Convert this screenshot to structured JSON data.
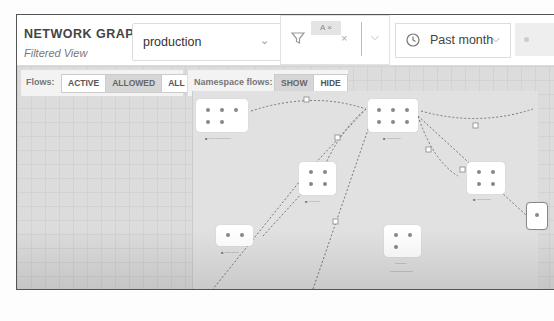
{
  "header": {
    "title": "NETWORK GRAPH",
    "subtitle": "Filtered View",
    "namespace_select": {
      "value": "production",
      "chevron": "chevron-down-icon"
    },
    "filter": {
      "chip_label": "A",
      "chip_remove": "×",
      "clear": "×",
      "chevron": "⌵"
    },
    "time_select": {
      "value": "Past month",
      "chevron": "⌵"
    }
  },
  "toolbar": {
    "flows_label": "Flows:",
    "flows_options": [
      "ACTIVE",
      "ALLOWED",
      "ALL"
    ],
    "flows_selected": "ALLOWED",
    "ns_flows_label": "Namespace flows:",
    "ns_flows_options": [
      "SHOW",
      "HIDE"
    ]
  },
  "graph": {
    "nodes": [
      {
        "id": "n1",
        "dots": 5
      },
      {
        "id": "n2",
        "dots": 6
      },
      {
        "id": "n3",
        "dots": 4
      },
      {
        "id": "n4",
        "dots": 4
      },
      {
        "id": "n5",
        "dots": 2
      },
      {
        "id": "n6",
        "dots": 3
      },
      {
        "id": "n7",
        "dots": 2
      }
    ]
  },
  "colors": {
    "edge": "#777777",
    "canvas": "#dcdcdc",
    "node": "#ffffff"
  }
}
